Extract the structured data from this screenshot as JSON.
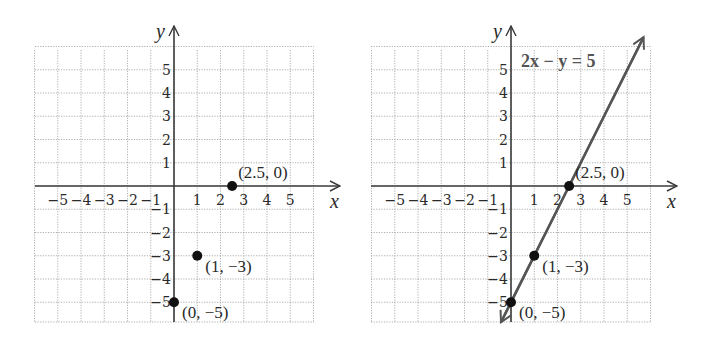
{
  "chart_data": [
    {
      "type": "scatter",
      "title": "",
      "xlabel": "x",
      "ylabel": "y",
      "xlim": [
        -6,
        6
      ],
      "ylim": [
        -5.85,
        6
      ],
      "grid": true,
      "x_ticks": [
        -5,
        -4,
        -3,
        -2,
        -1,
        1,
        2,
        3,
        4,
        5
      ],
      "y_ticks": [
        5,
        4,
        3,
        2,
        1,
        -1,
        -2,
        -3,
        -4,
        -5
      ],
      "points": [
        {
          "x": 2.5,
          "y": 0,
          "label": "(2.5, 0)"
        },
        {
          "x": 1,
          "y": -3,
          "label": "(1, −3)"
        },
        {
          "x": 0,
          "y": -5,
          "label": "(0, −5)"
        }
      ],
      "line": null
    },
    {
      "type": "line",
      "title": "",
      "xlabel": "x",
      "ylabel": "y",
      "xlim": [
        -6,
        6
      ],
      "ylim": [
        -5.85,
        6
      ],
      "grid": true,
      "x_ticks": [
        -5,
        -4,
        -3,
        -2,
        -1,
        1,
        2,
        3,
        4,
        5
      ],
      "y_ticks": [
        5,
        4,
        3,
        2,
        1,
        -1,
        -2,
        -3,
        -4,
        -5
      ],
      "points": [
        {
          "x": 2.5,
          "y": 0,
          "label": "(2.5, 0)"
        },
        {
          "x": 1,
          "y": -3,
          "label": "(1, −3)"
        },
        {
          "x": 0,
          "y": -5,
          "label": "(0, −5)"
        }
      ],
      "line": {
        "equation": "2x − y = 5",
        "slope": 2,
        "intercept": -5,
        "x_range": [
          -0.43,
          5.7
        ],
        "color": "#555555"
      }
    }
  ],
  "layout": {
    "plots": [
      {
        "origin_x": 174,
        "origin_y": 186,
        "unit": 23.25,
        "grid_left": 35,
        "grid_right": 314,
        "grid_top": 50,
        "grid_bottom": 322
      },
      {
        "origin_x": 511,
        "origin_y": 186,
        "unit": 23.25,
        "grid_left": 371,
        "grid_right": 651,
        "grid_top": 50,
        "grid_bottom": 322
      }
    ]
  }
}
